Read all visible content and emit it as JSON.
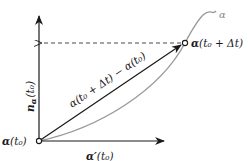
{
  "diagram": {
    "colors": {
      "ink": "#1a1a1a",
      "curve": "#9a9a9a",
      "dashed": "#333333",
      "background": "#ffffff"
    },
    "curve": {
      "name": "α"
    },
    "points": {
      "origin": {
        "label_main": "α",
        "label_arg": "(t₀)"
      },
      "target": {
        "label_main": "α",
        "label_arg": "(t₀ + Δt)"
      }
    },
    "vectors": {
      "tangent": {
        "label_main": "α′",
        "label_arg": "(t₀)"
      },
      "normal": {
        "label_main": "n",
        "label_sub": "α",
        "label_arg": "(t₀)"
      },
      "secant": {
        "label": "α(t₀ + Δt) − α(t₀)"
      }
    },
    "guides": {
      "dashed_projection": "horizontal dashed line from α(t₀ + Δt) to normal axis"
    }
  }
}
